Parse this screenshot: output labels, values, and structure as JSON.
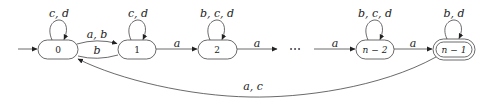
{
  "diagram": {
    "type": "finite-automaton",
    "states": [
      {
        "id": "s0",
        "label": "0",
        "initial": true,
        "accepting": false,
        "self_loop": "c, d"
      },
      {
        "id": "s1",
        "label": "1",
        "initial": false,
        "accepting": false,
        "self_loop": "c, d"
      },
      {
        "id": "s2",
        "label": "2",
        "initial": false,
        "accepting": false,
        "self_loop": "b, c, d"
      },
      {
        "id": "sn2",
        "label": "n − 2",
        "initial": false,
        "accepting": false,
        "self_loop": "b, c, d"
      },
      {
        "id": "sn1",
        "label": "n − 1",
        "initial": false,
        "accepting": true,
        "self_loop": "b, d"
      }
    ],
    "ellipsis": "⋯",
    "edges": [
      {
        "from": "s0",
        "to": "s1",
        "label": "a, b"
      },
      {
        "from": "s1",
        "to": "s0",
        "label": "b"
      },
      {
        "from": "s1",
        "to": "s2",
        "label": "a"
      },
      {
        "from": "s2",
        "to": "dots",
        "label": "a"
      },
      {
        "from": "dots",
        "to": "sn2",
        "label": "a"
      },
      {
        "from": "sn2",
        "to": "sn1",
        "label": "a"
      },
      {
        "from": "sn1",
        "to": "s0",
        "label": "a, c"
      }
    ]
  }
}
